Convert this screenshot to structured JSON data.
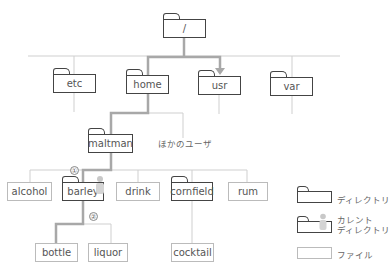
{
  "diagram": {
    "root": {
      "label": "/"
    },
    "level1": [
      {
        "label": "etc"
      },
      {
        "label": "home"
      },
      {
        "label": "usr"
      },
      {
        "label": "var"
      }
    ],
    "user_dir": {
      "label": "maltman"
    },
    "other_users_label": "ほかのユーザ",
    "level3": [
      {
        "label": "alcohol",
        "type": "file"
      },
      {
        "label": "barley",
        "type": "current-directory"
      },
      {
        "label": "drink",
        "type": "file"
      },
      {
        "label": "cornfield",
        "type": "directory"
      },
      {
        "label": "rum",
        "type": "file"
      }
    ],
    "barley_children": [
      {
        "label": "bottle"
      },
      {
        "label": "liquor"
      }
    ],
    "cornfield_children": [
      {
        "label": "cocktail"
      }
    ],
    "markers": {
      "one": "①",
      "two": "②"
    }
  },
  "legend": {
    "directory": "ディレクトリ",
    "current_line1": "カレント",
    "current_line2": "ディレクトリ",
    "file": "ファイル"
  },
  "colors": {
    "path_highlight": "#a8a8a8",
    "thin_line": "#cccccc",
    "dir_border": "#444444",
    "file_border": "#bbbbbb"
  }
}
